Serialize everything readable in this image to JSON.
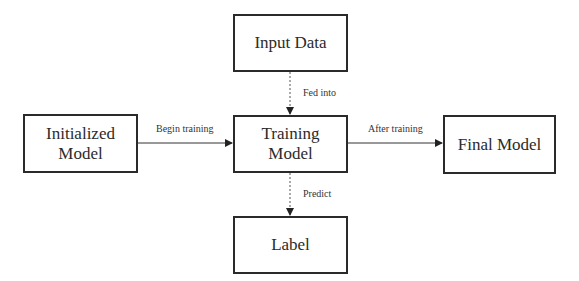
{
  "diagram": {
    "nodes": {
      "input_data": {
        "label": "Input Data"
      },
      "initialized_model": {
        "label": "Initialized Model",
        "line1": "Initialized",
        "line2": "Model"
      },
      "training_model": {
        "label": "Training Model",
        "line1": "Training",
        "line2": "Model"
      },
      "final_model": {
        "label": "Final Model"
      },
      "label": {
        "label": "Label"
      }
    },
    "edges": [
      {
        "from": "input_data",
        "to": "training_model",
        "label": "Fed into",
        "style": "dashed"
      },
      {
        "from": "initialized_model",
        "to": "training_model",
        "label": "Begin training",
        "style": "solid"
      },
      {
        "from": "training_model",
        "to": "final_model",
        "label": "After training",
        "style": "solid"
      },
      {
        "from": "training_model",
        "to": "label",
        "label": "Predict",
        "style": "dashed"
      }
    ]
  }
}
